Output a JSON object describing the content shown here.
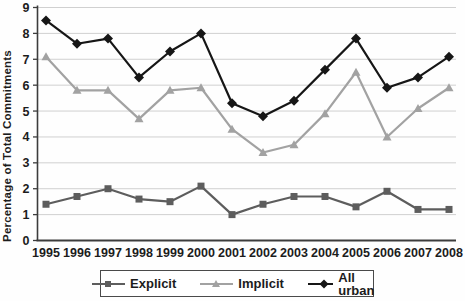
{
  "figure": {
    "background": "#ffffff",
    "text_color": "#1c1c1c",
    "axis_color": "#3c3c3c",
    "gridline_color": "#d0d0d0"
  },
  "chart_data": {
    "type": "line",
    "title": "",
    "xlabel": "",
    "ylabel": "Percentage of Total Commitments",
    "x": [
      "1995",
      "1996",
      "1997",
      "1998",
      "1999",
      "2000",
      "2001",
      "2002",
      "2003",
      "2004",
      "2005",
      "2006",
      "2007",
      "2008"
    ],
    "ylim": [
      0,
      9
    ],
    "yticks": [
      0,
      1,
      2,
      3,
      4,
      5,
      6,
      7,
      8,
      9
    ],
    "grid": "horizontal",
    "legend_position": "bottom",
    "series": [
      {
        "name": "Explicit",
        "marker": "square",
        "color": "#5d5d5d",
        "values": [
          1.4,
          1.7,
          2.0,
          1.6,
          1.5,
          2.1,
          1.0,
          1.4,
          1.7,
          1.7,
          1.3,
          1.9,
          1.2,
          1.2
        ]
      },
      {
        "name": "Implicit",
        "marker": "triangle",
        "color": "#a2a2a2",
        "values": [
          7.1,
          5.8,
          5.8,
          4.7,
          5.8,
          5.9,
          4.3,
          3.4,
          3.7,
          4.9,
          6.5,
          4.0,
          5.1,
          5.9
        ]
      },
      {
        "name": "All urban",
        "marker": "diamond",
        "color": "#161616",
        "values": [
          8.5,
          7.6,
          7.8,
          6.3,
          7.3,
          8.0,
          5.3,
          4.8,
          5.4,
          6.6,
          7.8,
          5.9,
          6.3,
          7.1
        ]
      }
    ]
  }
}
